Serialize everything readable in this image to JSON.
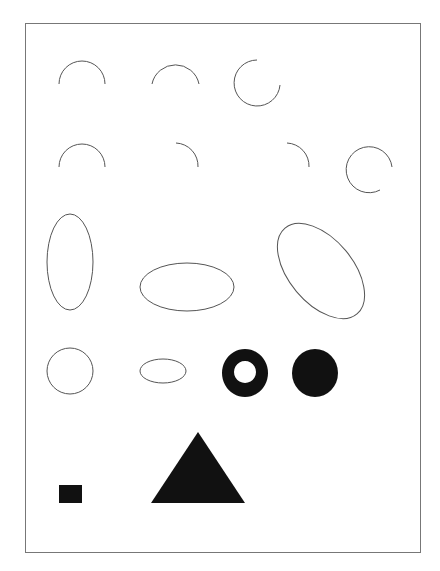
{
  "canvas": {
    "width": 440,
    "height": 571,
    "background": "#ffffff"
  },
  "frame": {
    "x": 25,
    "y": 23,
    "w": 395,
    "h": 529,
    "stroke": "#777777"
  },
  "colors": {
    "stroke": "#555555",
    "fill": "#111111"
  },
  "shapes": {
    "row1": [
      {
        "type": "arc",
        "description": "upper semicircle arc"
      },
      {
        "type": "arc",
        "description": "upper semicircle arc"
      },
      {
        "type": "arc",
        "description": "three-quarter circle arc open at upper right"
      }
    ],
    "row2": [
      {
        "type": "arc",
        "description": "upper semicircle arc"
      },
      {
        "type": "arc",
        "description": "quarter arc upper right"
      },
      {
        "type": "arc",
        "description": "quarter arc upper right"
      },
      {
        "type": "arc",
        "description": "near-complete circle open at lower right"
      }
    ],
    "row3": [
      {
        "type": "ellipse",
        "description": "vertical ellipse outline"
      },
      {
        "type": "ellipse",
        "description": "horizontal ellipse outline"
      },
      {
        "type": "ellipse",
        "description": "tilted ellipse outline"
      }
    ],
    "row4": [
      {
        "type": "circle",
        "description": "circle outline"
      },
      {
        "type": "ellipse",
        "description": "small horizontal ellipse outline"
      },
      {
        "type": "ring",
        "description": "filled black ring (donut)"
      },
      {
        "type": "circle",
        "description": "filled black circle"
      }
    ],
    "row5": [
      {
        "type": "rect",
        "description": "small filled black rectangle"
      },
      {
        "type": "triangle",
        "description": "filled black triangle"
      }
    ]
  }
}
